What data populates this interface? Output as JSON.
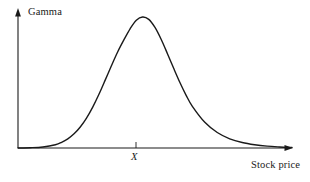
{
  "figure": {
    "width": 310,
    "height": 182,
    "background": "#ffffff",
    "ink_color": "#1a1a1a"
  },
  "labels": {
    "y_axis": "Gamma",
    "x_axis": "Stock price",
    "strike_tick": "X"
  },
  "chart_data": {
    "type": "line",
    "title": "",
    "subtitle": "",
    "xlabel": "Stock price",
    "ylabel": "Gamma",
    "grid": false,
    "legend": false,
    "legend_position": "none",
    "annotations": [
      {
        "text": "X",
        "meaning": "strike price",
        "x": 1.0,
        "axis": "x",
        "tick": true
      }
    ],
    "xlim": [
      0.0,
      2.2
    ],
    "ylim": [
      0.0,
      1.1
    ],
    "x_tick_values": [
      1.0
    ],
    "x_tick_labels": [
      "X"
    ],
    "y_tick_values": [],
    "y_tick_labels": [],
    "series": [
      {
        "name": "Gamma",
        "color": "#1a1a1a",
        "line_width": 1.4,
        "x": [
          0.0,
          0.1,
          0.2,
          0.3,
          0.35,
          0.4,
          0.45,
          0.5,
          0.55,
          0.6,
          0.65,
          0.7,
          0.75,
          0.8,
          0.85,
          0.9,
          0.95,
          1.0,
          1.05,
          1.1,
          1.15,
          1.2,
          1.25,
          1.3,
          1.35,
          1.4,
          1.5,
          1.6,
          1.7,
          1.8,
          1.9,
          2.0,
          2.1,
          2.2
        ],
        "y": [
          0.0,
          0.002,
          0.008,
          0.025,
          0.043,
          0.07,
          0.108,
          0.16,
          0.228,
          0.312,
          0.41,
          0.518,
          0.628,
          0.733,
          0.825,
          0.91,
          0.975,
          1.0,
          0.982,
          0.92,
          0.828,
          0.72,
          0.608,
          0.5,
          0.402,
          0.318,
          0.196,
          0.118,
          0.07,
          0.042,
          0.025,
          0.014,
          0.008,
          0.004
        ]
      }
    ],
    "peak": {
      "x": 0.98,
      "y": 1.0
    },
    "shape": "bell-shaped, slightly right-skewed, peaks near the strike price X and decays toward zero on both tails"
  },
  "geometry": {
    "origin_x": 18,
    "origin_y": 148,
    "y_axis_top": 10,
    "x_axis_right": 292,
    "peak_px": {
      "x": 133,
      "y": 17
    },
    "tick_px_x": 136,
    "tick_height": 6
  }
}
